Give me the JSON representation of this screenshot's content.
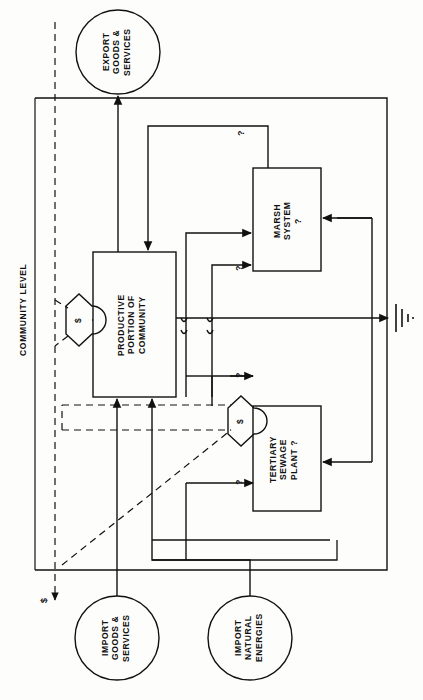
{
  "diagram": {
    "orientation": "rotated-90",
    "axis_label": "COMMUNITY LEVEL",
    "sources": [
      {
        "id": "export-goods-services",
        "label": "EXPORT\nGOODS &\nSERVICES",
        "shape": "circle",
        "cx": 118,
        "cy": 52,
        "r": 42
      },
      {
        "id": "import-goods-services",
        "label": "IMPORT\nGOODS &\nSERVICES",
        "shape": "circle",
        "cx": 117,
        "cy": 638,
        "r": 42
      },
      {
        "id": "import-natural-energies",
        "label": "IMPORT\nNATURAL\nENERGIES",
        "shape": "circle",
        "cx": 250,
        "cy": 638,
        "r": 42
      }
    ],
    "processes": [
      {
        "id": "productive-portion-of-community",
        "label": "PRODUCTIVE\nPORTION OF\nCOMMUNITY",
        "shape": "rect",
        "x": 93,
        "y": 252,
        "w": 83,
        "h": 145
      },
      {
        "id": "marsh-system",
        "label": "MARSH\nSYSTEM\n?",
        "shape": "rect",
        "x": 253,
        "y": 168,
        "w": 68,
        "h": 103
      },
      {
        "id": "tertiary-sewage-plant",
        "label": "TERTIARY\nSEWAGE\nPLANT ?",
        "shape": "rect",
        "x": 253,
        "y": 406,
        "w": 68,
        "h": 105
      }
    ],
    "transactions": [
      {
        "id": "transaction-community-export",
        "symbol": "$",
        "cx": 79,
        "cy": 320
      },
      {
        "id": "transaction-sewage-payment",
        "symbol": "$",
        "cx": 241,
        "cy": 421
      }
    ],
    "flow_labels": [
      {
        "id": "unknown-flow-1",
        "text": "?",
        "x": 240,
        "y": 133
      },
      {
        "id": "unknown-flow-2",
        "text": "?",
        "x": 238,
        "y": 268
      },
      {
        "id": "unknown-flow-3",
        "text": "?",
        "x": 238,
        "y": 375
      },
      {
        "id": "unknown-flow-4",
        "text": "?",
        "x": 238,
        "y": 482
      },
      {
        "id": "money-flow",
        "text": "$",
        "x": 44,
        "y": 600
      }
    ],
    "heat_sink": {
      "id": "heat-sink-ground",
      "label": "heat-sink",
      "x": 392,
      "y": 318
    },
    "frame": {
      "x": 35,
      "y": 98,
      "w": 352,
      "h": 472
    },
    "colors": {
      "line": "#111111",
      "background": "#fdfdfb",
      "text": "#111111"
    }
  }
}
